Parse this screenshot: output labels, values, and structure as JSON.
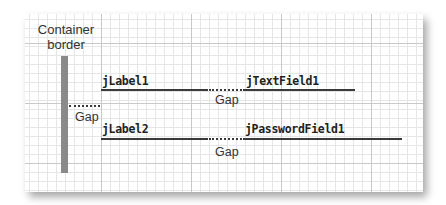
{
  "container_label": [
    "Container",
    "border"
  ],
  "rows": [
    {
      "label": "jLabel1",
      "field": "jTextField1",
      "gap_label": "Gap"
    },
    {
      "label": "jLabel2",
      "field": "jPasswordField1",
      "gap_label": "Gap"
    }
  ],
  "left_gap_label": "Gap",
  "colors": {
    "container_border": "#8a8a8a",
    "line": "#3a3a3a",
    "grid_major": "#c9c9c9",
    "grid_minor": "#e6e6e6"
  }
}
